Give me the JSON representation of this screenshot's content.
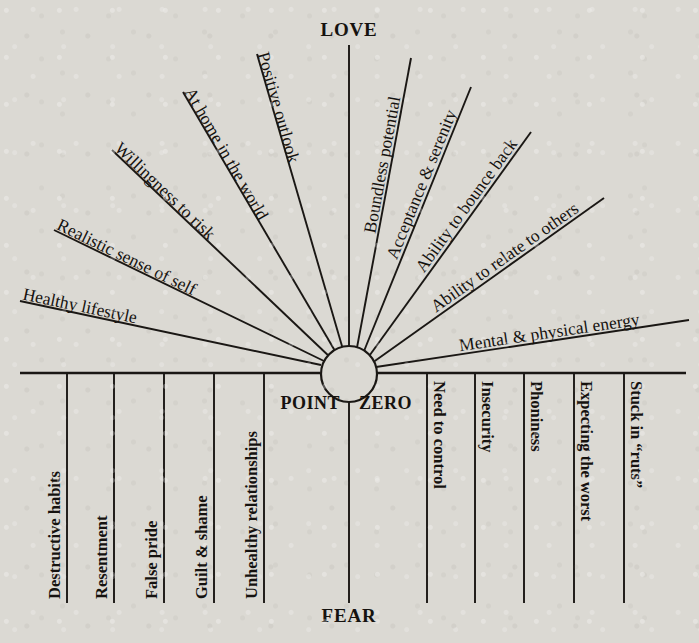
{
  "diagram": {
    "title_top": "LOVE",
    "title_bottom": "FEAR",
    "center_left_label": "POINT",
    "center_right_label": "ZERO",
    "center_full_label": "POINT ZERO",
    "ink_color": "#1a1714",
    "paper_color": "#dbd9d3",
    "upper_spokes": [
      {
        "label": "Healthy lifestyle",
        "angle_deg": 196
      },
      {
        "label": "Realistic sense of self",
        "angle_deg": 207
      },
      {
        "label": "Willingness to risk",
        "angle_deg": 221
      },
      {
        "label": "At home in the world",
        "angle_deg": 237
      },
      {
        "label": "Positive outlook",
        "angle_deg": 254
      },
      {
        "label": "LOVE",
        "angle_deg": 270
      },
      {
        "label": "Boundless potential",
        "angle_deg": 286
      },
      {
        "label": "Acceptance & serenity",
        "angle_deg": 302
      },
      {
        "label": "Ability to bounce back",
        "angle_deg": 316
      },
      {
        "label": "Ability to relate to others",
        "angle_deg": 330
      },
      {
        "label": "Mental & physical energy",
        "angle_deg": 342
      }
    ],
    "upper_spoke_labels": [
      "Healthy lifestyle",
      "Realistic sense of self",
      "Willingness to risk",
      "At home in the world",
      "Positive outlook",
      "Boundless potential",
      "Acceptance & serenity",
      "Ability to bounce back",
      "Ability to relate to others",
      "Mental & physical energy"
    ],
    "lower_columns_left": [
      "Destructive habits",
      "Resentment",
      "False pride",
      "Guilt & shame",
      "Unhealthy relationships"
    ],
    "lower_columns_right": [
      "Need to control",
      "Insecurity",
      "Phoniness",
      "Expecting the worst",
      "Stuck in “ruts”"
    ]
  }
}
